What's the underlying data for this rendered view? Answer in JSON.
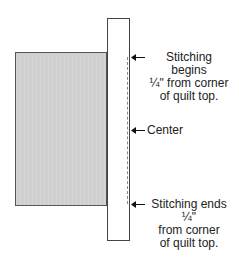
{
  "diagram": {
    "labels": {
      "top": [
        "Stitching begins",
        "¼\" from corner",
        "of quilt top."
      ],
      "center": "Center",
      "bottom": [
        "Stitching ends ¼\"",
        "from corner",
        "of quilt top."
      ]
    },
    "colors": {
      "quilt_fill": "#cfcfcf",
      "strip_fill": "#ffffff",
      "outline": "#444444"
    }
  }
}
